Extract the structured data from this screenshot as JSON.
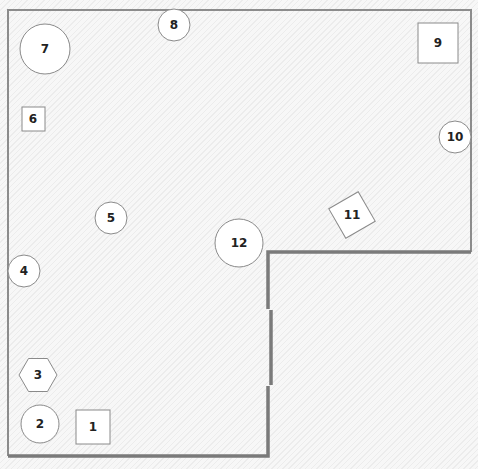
{
  "floorplan": {
    "colors": {
      "wall": "#7a7a7a",
      "shape_fill": "#ffffff",
      "shape_stroke": "#8a8a8a",
      "label": "#222222"
    },
    "items": [
      {
        "id": "1",
        "label": "1",
        "shape": "square",
        "cx": 93,
        "cy": 427,
        "size": 34
      },
      {
        "id": "2",
        "label": "2",
        "shape": "circle",
        "cx": 40,
        "cy": 424,
        "r": 19
      },
      {
        "id": "3",
        "label": "3",
        "shape": "hexagon",
        "cx": 38,
        "cy": 375,
        "r": 19
      },
      {
        "id": "4",
        "label": "4",
        "shape": "circle",
        "cx": 24,
        "cy": 271,
        "r": 16
      },
      {
        "id": "5",
        "label": "5",
        "shape": "circle",
        "cx": 111,
        "cy": 218,
        "r": 16
      },
      {
        "id": "6",
        "label": "6",
        "shape": "square",
        "cx": 33,
        "cy": 119,
        "size": 24
      },
      {
        "id": "7",
        "label": "7",
        "shape": "circle",
        "cx": 45,
        "cy": 49,
        "r": 25
      },
      {
        "id": "8",
        "label": "8",
        "shape": "circle",
        "cx": 174,
        "cy": 25,
        "r": 16
      },
      {
        "id": "9",
        "label": "9",
        "shape": "square",
        "cx": 438,
        "cy": 43,
        "size": 40
      },
      {
        "id": "10",
        "label": "10",
        "shape": "circle",
        "cx": 455,
        "cy": 137,
        "r": 16
      },
      {
        "id": "11",
        "label": "11",
        "shape": "rotated-square",
        "cx": 352,
        "cy": 215,
        "size": 34,
        "rotation": -30
      },
      {
        "id": "12",
        "label": "12",
        "shape": "circle",
        "cx": 239,
        "cy": 243,
        "r": 24
      }
    ]
  }
}
